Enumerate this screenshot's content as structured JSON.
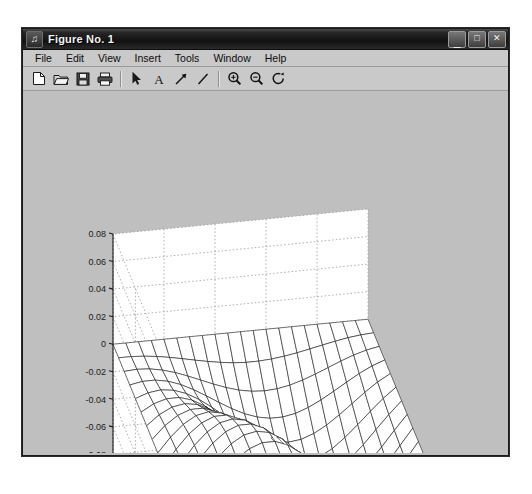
{
  "window": {
    "title": "Figure No. 1",
    "icon": "figure-icon",
    "controls": [
      {
        "name": "minimize",
        "glyph": "_"
      },
      {
        "name": "maximize",
        "glyph": "□"
      },
      {
        "name": "close",
        "glyph": "✕"
      }
    ]
  },
  "menu": {
    "items": [
      {
        "label": "File"
      },
      {
        "label": "Edit"
      },
      {
        "label": "View"
      },
      {
        "label": "Insert"
      },
      {
        "label": "Tools"
      },
      {
        "label": "Window"
      },
      {
        "label": "Help"
      }
    ]
  },
  "toolbar": {
    "items": [
      {
        "name": "new-figure-icon",
        "kind": "icon"
      },
      {
        "name": "open-file-icon",
        "kind": "icon"
      },
      {
        "name": "save-figure-icon",
        "kind": "icon"
      },
      {
        "name": "print-figure-icon",
        "kind": "icon"
      },
      {
        "name": "separator-1",
        "kind": "sep"
      },
      {
        "name": "pointer-icon",
        "kind": "icon"
      },
      {
        "name": "insert-text-icon",
        "kind": "icon"
      },
      {
        "name": "insert-arrow-icon",
        "kind": "icon"
      },
      {
        "name": "insert-line-icon",
        "kind": "icon"
      },
      {
        "name": "separator-2",
        "kind": "sep"
      },
      {
        "name": "zoom-in-icon",
        "kind": "icon"
      },
      {
        "name": "zoom-out-icon",
        "kind": "icon"
      },
      {
        "name": "rotate-3d-icon",
        "kind": "icon"
      }
    ]
  },
  "colors": {
    "figure_background": "#bfbfbf",
    "axes_background": "#ffffff",
    "mesh_line": "#1a1a1a",
    "grid_line": "#9a9a9a",
    "titlebar": "#111111"
  },
  "chart_data": {
    "type": "surface",
    "title": "",
    "xlabel": "",
    "ylabel": "",
    "zlabel": "",
    "projection": "3d-mesh",
    "grid": true,
    "legend": null,
    "xlim": [
      0,
      1
    ],
    "ylim": [
      0,
      1
    ],
    "zlim": [
      -0.1,
      0.08
    ],
    "xticks": [
      1,
      0.5,
      0
    ],
    "xtick_labels": [
      "1",
      "0.5",
      "0"
    ],
    "yticks": [
      1,
      0.8,
      0.6,
      0.4,
      0.2,
      0
    ],
    "ytick_labels": [
      "1",
      "0.8",
      "0.6",
      "0.4",
      "0.2",
      "0"
    ],
    "zticks": [
      0.08,
      0.06,
      0.04,
      0.02,
      0,
      -0.02,
      -0.04,
      -0.06,
      -0.08,
      -0.1
    ],
    "ztick_labels": [
      "0.08",
      "0.06",
      "0.04",
      "0.02",
      "0",
      "-0.02",
      "-0.04",
      "-0.06",
      "-0.08",
      "-0.1"
    ],
    "surface": {
      "description": "Mesh surface with a positive peak near (x=0.35, y=0.7) reaching about 0.075 and a negative trough near (x=0.7, y=0.35) reaching about -0.1",
      "nx": 21,
      "ny": 21,
      "peak": {
        "x": 0.35,
        "y": 0.7,
        "z": 0.075
      },
      "trough": {
        "x": 0.7,
        "y": 0.35,
        "z": -0.1
      },
      "formula": "z = 0.08 * sin(pi*x) * sin(pi*y) * sin(pi*(x - y))"
    },
    "view": {
      "azimuth": -37.5,
      "elevation": 30
    }
  }
}
